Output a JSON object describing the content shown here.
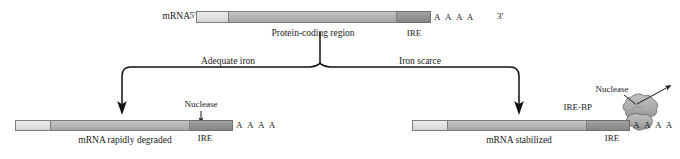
{
  "figure": {
    "background_color": "#ffffff",
    "ink_color": "#1a1a1a"
  },
  "colors": {
    "utr": "#e2e2e3",
    "coding": "#b6b7b6",
    "ire": "#949594",
    "protein_blob": "#a9aaa9",
    "outline": "#7d7d7d",
    "arrow": "#111111"
  },
  "top_transcript": {
    "name_label": "mRNA",
    "five_prime_label": "5′",
    "three_prime_label": "3′",
    "polya_label": "A A A A",
    "coding_label": "Protein-coding region",
    "ire_label": "IRE"
  },
  "branches": {
    "left_label": "Adequate iron",
    "right_label": "Iron scarce"
  },
  "left_outcome": {
    "caption": "mRNA rapidly degraded",
    "ire_label": "IRE",
    "nuclease_label": "Nuclease",
    "polya_label": "A A A A"
  },
  "right_outcome": {
    "caption": "mRNA stabilized",
    "ire_label": "IRE",
    "nuclease_label": "Nuclease",
    "binding_protein_label": "IRE-BP",
    "polya_label": "A A A A"
  }
}
